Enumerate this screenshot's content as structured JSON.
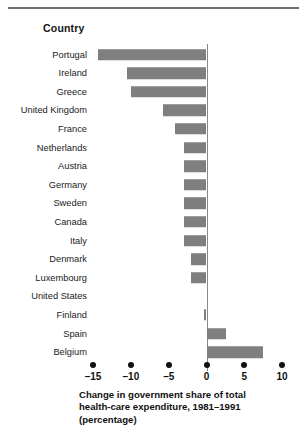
{
  "header": {
    "column_title": "Country"
  },
  "chart_data": {
    "type": "bar",
    "orientation": "horizontal",
    "title": "",
    "xlabel": "Change in government share of total health-care expenditure, 1981–1991 (percentage)",
    "ylabel": "Country",
    "xlim": [
      -15,
      10
    ],
    "grid": false,
    "legend": null,
    "bar_color": "#807f7f",
    "axis_ticks": [
      -15,
      -10,
      -5,
      0,
      5,
      10
    ],
    "tick_labels": [
      "–15",
      "–10",
      "–5",
      "0",
      "5",
      "10"
    ],
    "categories": [
      "Portugal",
      "Ireland",
      "Greece",
      "United Kingdom",
      "France",
      "Netherlands",
      "Austria",
      "Germany",
      "Sweden",
      "Canada",
      "Italy",
      "Denmark",
      "Luxembourg",
      "United States",
      "Finland",
      "Spain",
      "Belgium"
    ],
    "values": [
      -14.3,
      -10.5,
      -10.0,
      -5.7,
      -4.2,
      -3.0,
      -3.0,
      -3.0,
      -3.0,
      -3.0,
      -3.0,
      -2.0,
      -2.0,
      0.0,
      -0.3,
      2.6,
      7.5
    ]
  },
  "caption": {
    "line1": "Change in government share of total",
    "line2": "health-care expenditure, 1981–1991",
    "line3": "(percentage)"
  }
}
